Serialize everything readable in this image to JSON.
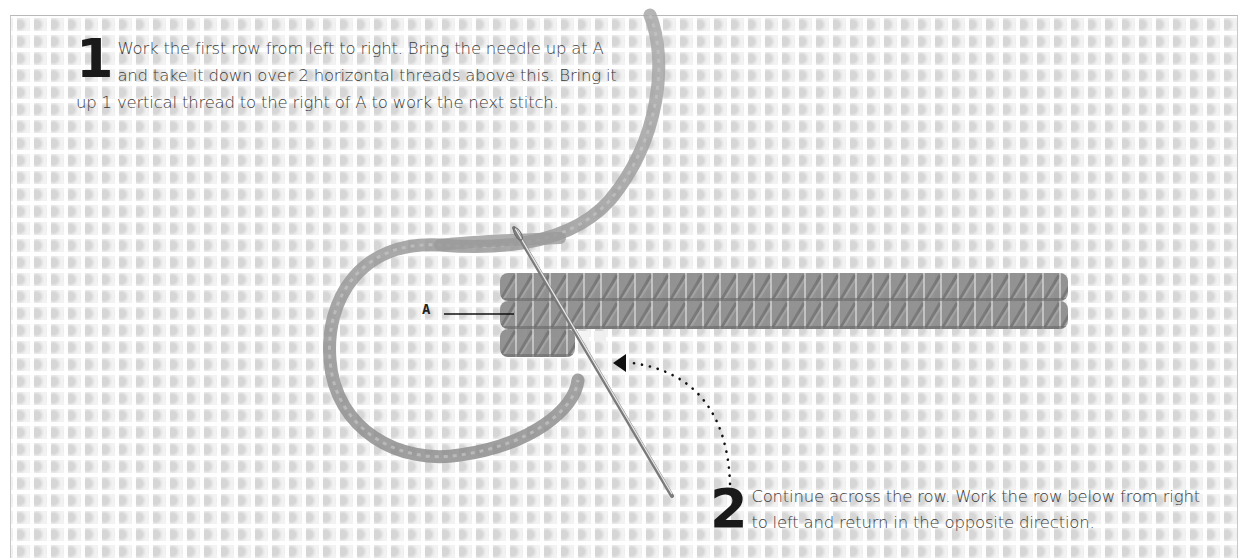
{
  "diagram": {
    "type": "needlepoint-stitch-instructions",
    "background": "plastic canvas mesh grid",
    "colors": {
      "text": "#3a3a3a",
      "step_number": "#1a1a1a",
      "yarn": "#9a9a9a",
      "stitch_dark": "#7c7c7c",
      "needle": "#8c8c8c",
      "leader_line": "#111111",
      "arrow": "#111111"
    }
  },
  "steps": [
    {
      "number": "1",
      "text": "Work the first row from left to right. Bring the needle up at A and take it down over 2 horizontal threads above this. Bring it up 1 vertical thread to the right of A to work the next stitch."
    },
    {
      "number": "2",
      "text": "Continue across the row. Work the row below from right to left and return in the opposite direction."
    }
  ],
  "labels": {
    "point_a": "A"
  },
  "icons": {
    "needle": "needle-icon",
    "yarn": "yarn-icon",
    "arrow": "dotted-arrow-icon"
  }
}
